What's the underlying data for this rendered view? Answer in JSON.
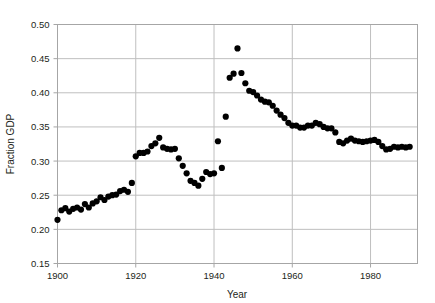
{
  "chart_data": {
    "type": "scatter",
    "title": "",
    "xlabel": "Year",
    "ylabel": "Fraction GDP",
    "xlim": [
      1900,
      1992
    ],
    "ylim": [
      0.15,
      0.5
    ],
    "xticks": [
      1900,
      1920,
      1940,
      1960,
      1980
    ],
    "xtick_labels": [
      "1900",
      "1920",
      "1940",
      "1960",
      "1980"
    ],
    "yticks": [
      0.15,
      0.2,
      0.25,
      0.3,
      0.35,
      0.4,
      0.45,
      0.5
    ],
    "ytick_labels": [
      "0.15",
      "0.20",
      "0.25",
      "0.30",
      "0.35",
      "0.40",
      "0.45",
      "0.50"
    ],
    "grid": true,
    "legend": "none",
    "marker": "circle",
    "marker_color": "#000000",
    "marker_size": 4.2,
    "frame_color": "#a6a6a6",
    "grid_color": "#bfbfbf",
    "background": "#ffffff",
    "x": [
      1900,
      1901,
      1902,
      1903,
      1904,
      1905,
      1906,
      1907,
      1908,
      1909,
      1910,
      1911,
      1912,
      1913,
      1914,
      1915,
      1916,
      1917,
      1918,
      1919,
      1920,
      1921,
      1922,
      1923,
      1924,
      1925,
      1926,
      1927,
      1928,
      1929,
      1930,
      1931,
      1932,
      1933,
      1934,
      1935,
      1936,
      1937,
      1938,
      1939,
      1940,
      1941,
      1942,
      1943,
      1944,
      1945,
      1946,
      1947,
      1948,
      1949,
      1950,
      1951,
      1952,
      1953,
      1954,
      1955,
      1956,
      1957,
      1958,
      1959,
      1960,
      1961,
      1962,
      1963,
      1964,
      1965,
      1966,
      1967,
      1968,
      1969,
      1970,
      1971,
      1972,
      1973,
      1974,
      1975,
      1976,
      1977,
      1978,
      1979,
      1980,
      1981,
      1982,
      1983,
      1984,
      1985,
      1986,
      1987,
      1988,
      1989,
      1990
    ],
    "y": [
      0.214,
      0.228,
      0.231,
      0.226,
      0.23,
      0.232,
      0.229,
      0.237,
      0.232,
      0.238,
      0.241,
      0.247,
      0.243,
      0.248,
      0.25,
      0.251,
      0.256,
      0.258,
      0.255,
      0.268,
      0.307,
      0.312,
      0.312,
      0.314,
      0.322,
      0.326,
      0.334,
      0.32,
      0.318,
      0.317,
      0.318,
      0.304,
      0.293,
      0.282,
      0.271,
      0.268,
      0.264,
      0.274,
      0.284,
      0.281,
      0.282,
      0.329,
      0.29,
      0.365,
      0.422,
      0.428,
      0.465,
      0.429,
      0.414,
      0.403,
      0.401,
      0.396,
      0.39,
      0.387,
      0.386,
      0.381,
      0.374,
      0.368,
      0.363,
      0.356,
      0.352,
      0.352,
      0.349,
      0.349,
      0.352,
      0.352,
      0.356,
      0.354,
      0.35,
      0.348,
      0.348,
      0.342,
      0.328,
      0.326,
      0.33,
      0.333,
      0.33,
      0.329,
      0.328,
      0.329,
      0.33,
      0.331,
      0.328,
      0.322,
      0.317,
      0.318,
      0.321,
      0.32,
      0.321,
      0.32,
      0.321
    ]
  }
}
